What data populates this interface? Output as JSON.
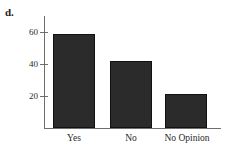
{
  "panel": {
    "label": "d."
  },
  "chart_data": {
    "type": "bar",
    "title": "",
    "subtitle": "",
    "xlabel": "",
    "ylabel": "",
    "categories": [
      "Yes",
      "No",
      "No Opinion"
    ],
    "values": [
      59,
      42,
      21
    ],
    "series": [
      {
        "name": "Responses",
        "values": [
          59,
          42,
          21
        ]
      }
    ],
    "ylim": [
      0,
      68
    ],
    "yticks": [
      20,
      40,
      60
    ],
    "ytick_labels": [
      "20",
      "40",
      "60"
    ],
    "xticks": [
      "Yes",
      "No",
      "No Opinion"
    ],
    "grid": false,
    "legend": false,
    "legend_position": "none",
    "bar_color": "#2b2b2b",
    "axis_color": "#6e6e6e",
    "background_color": "#ffffff",
    "annotations": []
  }
}
